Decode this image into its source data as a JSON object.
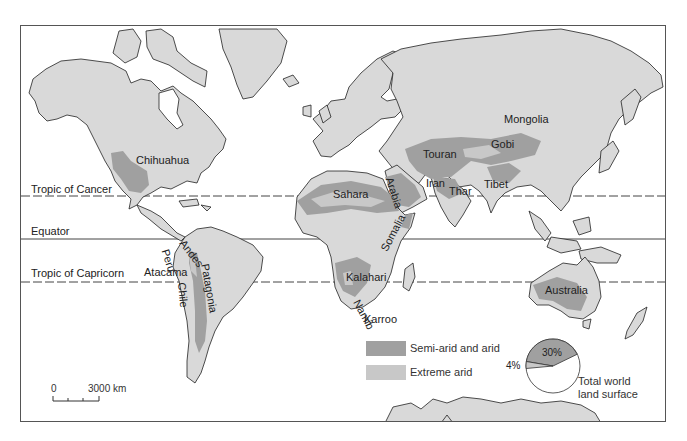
{
  "map": {
    "title": "World arid regions",
    "colors": {
      "land": "#d9d9d9",
      "semi_arid": "#a0a0a0",
      "extreme_arid": "#c8c8c8",
      "ocean": "#ffffff",
      "outline": "#222222"
    },
    "reference_lines": [
      {
        "label": "Tropic of Cancer",
        "style": "dashed"
      },
      {
        "label": "Equator",
        "style": "solid"
      },
      {
        "label": "Tropic of Capricorn",
        "style": "dashed"
      }
    ],
    "regions": [
      "Chihuahua",
      "Sahara",
      "Arabia",
      "Iran",
      "Thar",
      "Touran",
      "Gobi",
      "Mongolia",
      "Tibet",
      "Somalia",
      "Kalahari",
      "Namib",
      "Karroo",
      "Peru",
      "Chile",
      "Atacama",
      "Andes",
      "Patagonia",
      "Australia"
    ]
  },
  "legend": {
    "items": [
      {
        "label": "Semi-arid and arid",
        "color": "#a0a0a0"
      },
      {
        "label": "Extreme arid",
        "color": "#c8c8c8"
      }
    ]
  },
  "pie": {
    "slices": [
      {
        "label": "30%",
        "value": 30,
        "color": "#a0a0a0"
      },
      {
        "label": "4%",
        "value": 4,
        "color": "#c8c8c8"
      },
      {
        "label": "",
        "value": 66,
        "color": "#ffffff"
      }
    ],
    "caption_line1": "Total world",
    "caption_line2": "land surface"
  },
  "scale_bar": {
    "start": "0",
    "end": "3000 km"
  }
}
